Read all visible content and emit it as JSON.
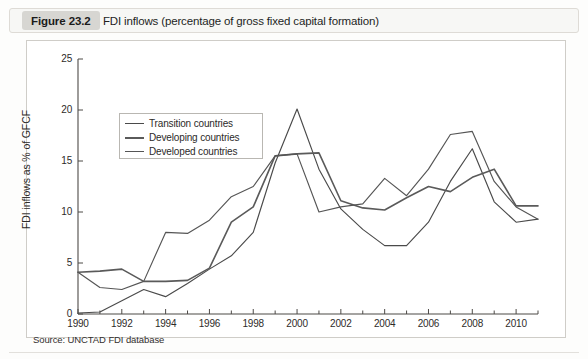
{
  "figure": {
    "badge_label": "Figure 23.2",
    "title": "FDI inflows (percentage of gross fixed capital formation)",
    "source": "Source: UNCTAD FDI database"
  },
  "chart_data": {
    "type": "line",
    "title": "FDI inflows (percentage of gross fixed capital formation)",
    "xlabel": "",
    "ylabel": "FDI inflows as % of GFCF",
    "xlim": [
      1990,
      2011
    ],
    "ylim": [
      0,
      25
    ],
    "yticks": [
      0,
      5,
      10,
      15,
      20,
      25
    ],
    "ytick_labels": [
      "0",
      "5",
      "10",
      "15",
      "20",
      "25"
    ],
    "xticks": [
      1990,
      1992,
      1994,
      1996,
      1998,
      2000,
      2002,
      2004,
      2006,
      2008,
      2010
    ],
    "xtick_labels": [
      "1990",
      "1992",
      "1994",
      "1996",
      "1998",
      "2000",
      "2002",
      "2004",
      "2006",
      "2008",
      "2010"
    ],
    "xminor_ticks": [
      1991,
      1993,
      1995,
      1997,
      1999,
      2001,
      2003,
      2005,
      2007,
      2009,
      2011
    ],
    "grid": false,
    "legend_position": "upper-left",
    "x": [
      1990,
      1991,
      1992,
      1993,
      1994,
      1995,
      1996,
      1997,
      1998,
      1999,
      2000,
      2001,
      2002,
      2003,
      2004,
      2005,
      2006,
      2007,
      2008,
      2009,
      2010,
      2011
    ],
    "series": [
      {
        "name": "Transition countries",
        "color": "#4a4a4a",
        "values": [
          0.1,
          0.2,
          1.3,
          2.4,
          1.7,
          3.0,
          4.4,
          5.7,
          8.0,
          14.8,
          20.1,
          14.2,
          10.3,
          8.3,
          6.7,
          6.7,
          9.0,
          13.0,
          16.2,
          11.0,
          9.0,
          9.3
        ]
      },
      {
        "name": "Developing countries",
        "color": "#5a5a5a",
        "values": [
          4.1,
          4.2,
          4.4,
          3.2,
          3.2,
          3.3,
          4.5,
          9.0,
          10.5,
          15.5,
          15.7,
          15.8,
          11.1,
          10.4,
          10.2,
          11.4,
          12.5,
          12.0,
          13.4,
          14.2,
          10.6,
          10.6
        ]
      },
      {
        "name": "Developed countries",
        "color": "#555555",
        "values": [
          4.1,
          2.6,
          2.4,
          3.2,
          8.0,
          7.9,
          9.2,
          11.5,
          12.5,
          15.5,
          15.7,
          10.0,
          10.5,
          10.8,
          13.3,
          11.6,
          14.2,
          17.6,
          17.9,
          13.0,
          10.5,
          9.3
        ]
      }
    ],
    "series_details": {
      "Transition countries": {
        "note": "Rises from near zero in 1990 to a 20.1 peak in 2000, dips to 6.7 in 2004, second peak 16.2 in 2008, falls to about 9.3 in 2011."
      },
      "Developing countries": {
        "note": "Starts at 4.1 in 1990, gradual rise, plateau near 15.7 in 2000-2001, dips to about 10.2 in 2004, peak 14.2 in 2009, ends about 10.6 in 2011."
      },
      "Developed countries": {
        "note": "Starts at 4.1 in 1990, drops to 2.4 in 1992, climbs to 15.5 in 1999, falls to 10.0 in 2001, rises to 17.9 in 2008, declines to about 9.3 in 2011."
      }
    }
  },
  "legend": {
    "items": [
      {
        "label": "Transition countries",
        "color": "#4a4a4a"
      },
      {
        "label": "Developing countries",
        "color": "#5a5a5a"
      },
      {
        "label": "Developed countries",
        "color": "#555555"
      }
    ]
  }
}
